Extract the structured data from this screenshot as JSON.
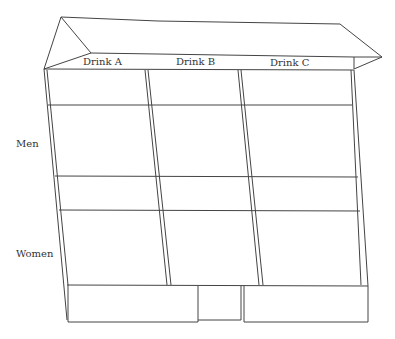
{
  "diagram": {
    "type": "3D box (two-way table tray)",
    "columns": [
      {
        "label": "Drink A"
      },
      {
        "label": "Drink B"
      },
      {
        "label": "Drink C"
      }
    ],
    "rows": [
      {
        "label": "Men"
      },
      {
        "label": "Women"
      }
    ],
    "colors": {
      "line": "#444444",
      "text": "#333333",
      "background": "#ffffff"
    }
  }
}
